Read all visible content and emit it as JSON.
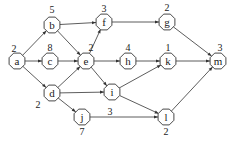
{
  "diagram": {
    "type": "directed-acyclic-graph",
    "colors": {
      "stroke": "#333333",
      "text": "#222222",
      "background": "#ffffff"
    },
    "nodes": [
      {
        "id": "a",
        "label": "a",
        "x": 17,
        "y": 61,
        "weight": "2",
        "wx": 14,
        "wy": 48
      },
      {
        "id": "b",
        "label": "b",
        "x": 52,
        "y": 25,
        "weight": "5",
        "wx": 52,
        "wy": 9
      },
      {
        "id": "c",
        "label": "c",
        "x": 50,
        "y": 61,
        "weight": "8",
        "wx": 50,
        "wy": 47
      },
      {
        "id": "d",
        "label": "d",
        "x": 52,
        "y": 93,
        "weight": "2",
        "wx": 38,
        "wy": 104
      },
      {
        "id": "e",
        "label": "e",
        "x": 86,
        "y": 61,
        "weight": "2",
        "wx": 91,
        "wy": 47
      },
      {
        "id": "f",
        "label": "f",
        "x": 104,
        "y": 22,
        "weight": "3",
        "wx": 104,
        "wy": 8
      },
      {
        "id": "g",
        "label": "g",
        "x": 167,
        "y": 22,
        "weight": "2",
        "wx": 167,
        "wy": 7
      },
      {
        "id": "h",
        "label": "h",
        "x": 128,
        "y": 61,
        "weight": "4",
        "wx": 128,
        "wy": 47
      },
      {
        "id": "i",
        "label": "i",
        "x": 112,
        "y": 92,
        "weight": "",
        "wx": 0,
        "wy": 0
      },
      {
        "id": "j",
        "label": "j",
        "x": 82,
        "y": 117,
        "weight": "7",
        "wx": 82,
        "wy": 131
      },
      {
        "id": "k",
        "label": "k",
        "x": 168,
        "y": 61,
        "weight": "1",
        "wx": 168,
        "wy": 47
      },
      {
        "id": "l",
        "label": "l",
        "x": 166,
        "y": 117,
        "weight": "2",
        "wx": 166,
        "wy": 131
      },
      {
        "id": "m",
        "label": "m",
        "x": 218,
        "y": 61,
        "weight": "3",
        "wx": 220,
        "wy": 47
      }
    ],
    "edges": [
      {
        "from": "a",
        "to": "b"
      },
      {
        "from": "a",
        "to": "c"
      },
      {
        "from": "a",
        "to": "d"
      },
      {
        "from": "b",
        "to": "f"
      },
      {
        "from": "b",
        "to": "e"
      },
      {
        "from": "c",
        "to": "e"
      },
      {
        "from": "d",
        "to": "e"
      },
      {
        "from": "d",
        "to": "i"
      },
      {
        "from": "d",
        "to": "j"
      },
      {
        "from": "e",
        "to": "f"
      },
      {
        "from": "e",
        "to": "h"
      },
      {
        "from": "e",
        "to": "i"
      },
      {
        "from": "f",
        "to": "g"
      },
      {
        "from": "g",
        "to": "m"
      },
      {
        "from": "h",
        "to": "k"
      },
      {
        "from": "i",
        "to": "k"
      },
      {
        "from": "i",
        "to": "l"
      },
      {
        "from": "j",
        "to": "l",
        "label": "3",
        "lx": 110,
        "ly": 111
      },
      {
        "from": "k",
        "to": "m"
      },
      {
        "from": "l",
        "to": "m"
      }
    ]
  }
}
